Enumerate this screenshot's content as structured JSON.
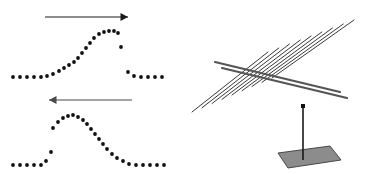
{
  "figure": {
    "width": 370,
    "height": 174,
    "background_color": "#ffffff",
    "ink_color": "#1a1a1a"
  },
  "left_panel": {
    "name": "dotted-pulse-plots",
    "dot": {
      "color": "#111111",
      "radius": 1.9,
      "shape": "circle"
    },
    "plots": [
      {
        "id": "top-pulse",
        "arrow": {
          "direction": "right",
          "color": "#1a1a1a",
          "x1": 45,
          "y1": 17,
          "x2": 128,
          "y2": 17,
          "head_size": 5,
          "line_width": 1.1
        },
        "points": [
          [
            13,
            77
          ],
          [
            20,
            77
          ],
          [
            27,
            77
          ],
          [
            34,
            77
          ],
          [
            41,
            77
          ],
          [
            47,
            76
          ],
          [
            53,
            74
          ],
          [
            59,
            71
          ],
          [
            64,
            68
          ],
          [
            69,
            65
          ],
          [
            74,
            62
          ],
          [
            78,
            58
          ],
          [
            82,
            53
          ],
          [
            86,
            48
          ],
          [
            90,
            43
          ],
          [
            94,
            38
          ],
          [
            99,
            34
          ],
          [
            104,
            32
          ],
          [
            109,
            31
          ],
          [
            114,
            31
          ],
          [
            118,
            33
          ],
          [
            121,
            47
          ],
          [
            128,
            72
          ],
          [
            134,
            76
          ],
          [
            141,
            77
          ],
          [
            148,
            77
          ],
          [
            155,
            77
          ],
          [
            162,
            77
          ]
        ]
      },
      {
        "id": "bottom-pulse",
        "arrow": {
          "direction": "left",
          "color": "#4a4a4a",
          "x1": 132,
          "y1": 100,
          "x2": 49,
          "y2": 100,
          "head_size": 5,
          "line_width": 1.1
        },
        "points": [
          [
            13,
            165
          ],
          [
            20,
            165
          ],
          [
            27,
            165
          ],
          [
            34,
            165
          ],
          [
            41,
            165
          ],
          [
            46,
            161
          ],
          [
            51,
            152
          ],
          [
            53,
            128
          ],
          [
            58,
            122
          ],
          [
            63,
            118
          ],
          [
            68,
            116
          ],
          [
            73,
            115
          ],
          [
            78,
            117
          ],
          [
            83,
            120
          ],
          [
            87,
            124
          ],
          [
            91,
            129
          ],
          [
            95,
            134
          ],
          [
            99,
            139
          ],
          [
            103,
            144
          ],
          [
            107,
            149
          ],
          [
            112,
            154
          ],
          [
            117,
            158
          ],
          [
            123,
            161
          ],
          [
            129,
            164
          ],
          [
            136,
            165
          ],
          [
            143,
            165
          ],
          [
            150,
            165
          ],
          [
            157,
            165
          ],
          [
            164,
            165
          ]
        ]
      }
    ]
  },
  "right_panel": {
    "name": "wire-grid-polarizer",
    "colors": {
      "wire": "#3a3a3a",
      "rod": "#555555",
      "pole": "#1a1a1a",
      "base_fill": "#8c8c8c",
      "base_stroke": "#3a3a3a",
      "hub": "#111111"
    },
    "grating": {
      "wire_count": 9,
      "wire_width": 1.0,
      "orientation": "diagonal, lower-left to upper-right"
    },
    "support_rods": {
      "count": 2,
      "width": 2.2,
      "cap": "rounded"
    },
    "pole": {
      "x": 303,
      "top_y": 106,
      "bottom_y": 160,
      "width": 1.6
    },
    "hub": {
      "x": 303,
      "y": 106,
      "size": 4
    },
    "base": {
      "shape": "parallelogram",
      "points": "288,168 278,153 330,146 341,160",
      "fill": "#8c8c8c"
    }
  }
}
